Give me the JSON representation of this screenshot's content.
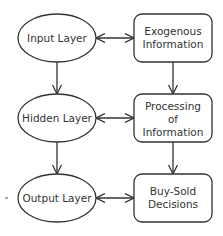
{
  "diagram": {
    "left_nodes": [
      {
        "id": "input",
        "shape": "ellipse",
        "lines": [
          "Input Layer"
        ]
      },
      {
        "id": "hidden",
        "shape": "ellipse",
        "lines": [
          "Hidden Layer"
        ]
      },
      {
        "id": "output",
        "shape": "ellipse",
        "lines": [
          "Output Layer"
        ]
      }
    ],
    "right_nodes": [
      {
        "id": "exogenous",
        "shape": "rounded-rect",
        "lines": [
          "Exogenous",
          "Information"
        ]
      },
      {
        "id": "processing",
        "shape": "rounded-rect",
        "lines": [
          "Processing",
          "of",
          "Information"
        ]
      },
      {
        "id": "decisions",
        "shape": "rounded-rect",
        "lines": [
          "Buy-Sold",
          "Decisions"
        ]
      }
    ],
    "edges": [
      {
        "from": "input",
        "to": "hidden",
        "type": "arrow"
      },
      {
        "from": "hidden",
        "to": "output",
        "type": "arrow"
      },
      {
        "from": "exogenous",
        "to": "processing",
        "type": "arrow"
      },
      {
        "from": "processing",
        "to": "decisions",
        "type": "arrow"
      },
      {
        "from": "input",
        "to": "exogenous",
        "type": "bidirectional"
      },
      {
        "from": "hidden",
        "to": "processing",
        "type": "bidirectional"
      },
      {
        "from": "output",
        "to": "decisions",
        "type": "bidirectional"
      }
    ],
    "colors": {
      "stroke": "#333333",
      "text": "#333333",
      "background": "#ffffff"
    }
  }
}
